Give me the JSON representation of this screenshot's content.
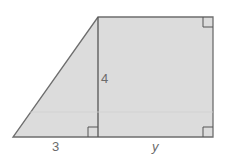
{
  "figure": {
    "shape": "trapezoid composed of right triangle and rectangle",
    "fill_color": "#dcdcdc",
    "stroke_color": "#6e6e6e",
    "labels": {
      "height": "4",
      "triangle_base": "3",
      "rectangle_base": "y"
    },
    "right_angle_markers": [
      "top-right",
      "bottom-right",
      "triangle-foot"
    ]
  }
}
